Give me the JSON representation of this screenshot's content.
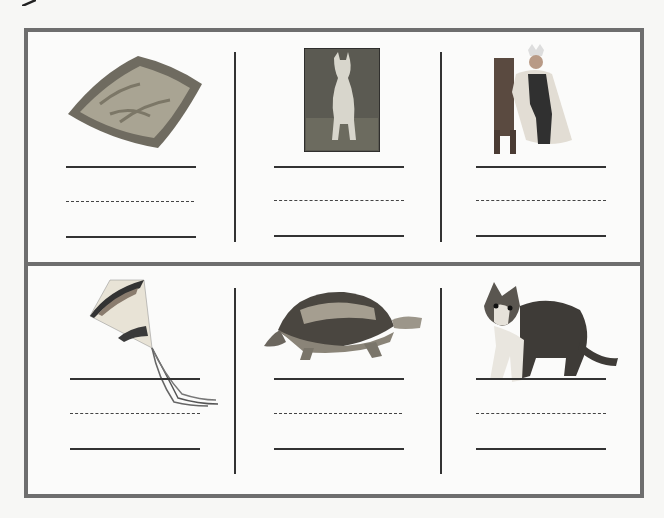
{
  "worksheet": {
    "type": "picture word-writing worksheet",
    "rows": 2,
    "columns": 3,
    "border_color": "#6e6e6e",
    "line_color": "#333333",
    "items": [
      {
        "row": 1,
        "col": 1,
        "picture": "pillow",
        "answer": ""
      },
      {
        "row": 1,
        "col": 2,
        "picture": "kangaroo",
        "answer": ""
      },
      {
        "row": 1,
        "col": 3,
        "picture": "king",
        "answer": ""
      },
      {
        "row": 2,
        "col": 1,
        "picture": "kite",
        "answer": ""
      },
      {
        "row": 2,
        "col": 2,
        "picture": "turtle",
        "answer": ""
      },
      {
        "row": 2,
        "col": 3,
        "picture": "kitten",
        "answer": ""
      }
    ]
  }
}
